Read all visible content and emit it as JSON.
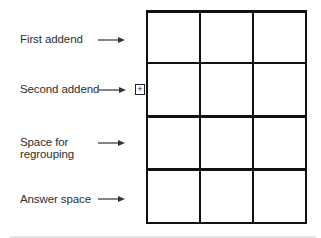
{
  "diagram": {
    "labels": [
      {
        "text": "First addend",
        "top": 33
      },
      {
        "text": "Second addend",
        "top": 83
      },
      {
        "text": "Space for",
        "top": 136
      },
      {
        "text": "regrouping",
        "top": 148
      },
      {
        "text": "Answer space",
        "top": 193
      }
    ],
    "operator_symbol": "+",
    "grid": {
      "columns": 3,
      "rows": 4,
      "row_roles": [
        "First addend",
        "Second addend",
        "Space for regrouping",
        "Answer space"
      ]
    }
  }
}
